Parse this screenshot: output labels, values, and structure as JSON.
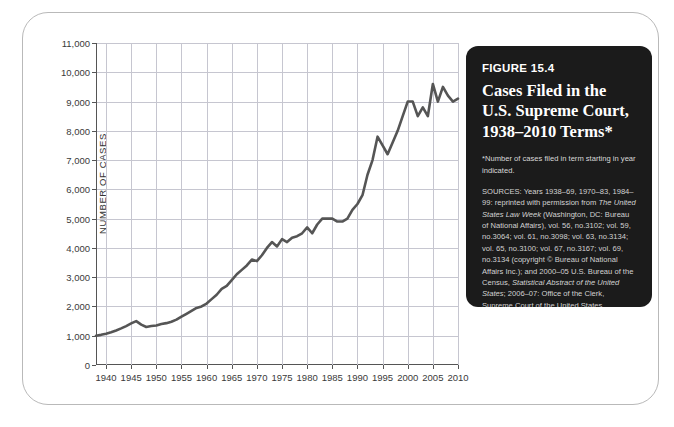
{
  "figure": {
    "number_label": "FIGURE 15.4",
    "title": "Cases Filed in the U.S. Supreme Court, 1938–2010 Terms*",
    "note": "*Number of cases filed in term starting in year indicated.",
    "sources_prefix": "SOURCES: Years 1938–69, 1970–83, 1984–99: reprinted with permission from ",
    "sources_italic_1": "The United States Law Week",
    "sources_mid": " (Washington, DC: Bureau of National Affairs), vol. 56, no.3102; vol. 59, no.3064; vol. 61, no.3098; vol. 63, no.3134; vol. 65, no.3100; vol. 67, no.3167; vol. 69, no.3134 (copyright © Bureau of National Affairs Inc.); and 2000–05 U.S. Bureau of the Census, ",
    "sources_italic_2": "Statistical Abstract of the United States",
    "sources_suffix": "; 2006–07: Office of the Clerk, Supreme Court of the United States."
  },
  "colors": {
    "panel_background": "#1b1b1b",
    "series_line": "#555555",
    "gridline": "#c6c6d0",
    "axis": "#555555",
    "frame_border": "#b9b9b9",
    "page_background": "#ffffff"
  },
  "chart_data": {
    "type": "line",
    "title": "Cases Filed in the U.S. Supreme Court, 1938–2010 Terms",
    "xlabel": "",
    "ylabel": "NUMBER OF CASES",
    "xlim": [
      1938,
      2010
    ],
    "ylim": [
      0,
      11000
    ],
    "ytick_values": [
      0,
      1000,
      2000,
      3000,
      4000,
      5000,
      6000,
      7000,
      8000,
      9000,
      10000,
      11000
    ],
    "ytick_labels": [
      "0",
      "1,000",
      "2,000",
      "3,000",
      "4,000",
      "5,000",
      "6,000",
      "7,000",
      "8,000",
      "9,000",
      "10,000",
      "11,000"
    ],
    "xtick_values": [
      1940,
      1945,
      1950,
      1955,
      1960,
      1965,
      1970,
      1975,
      1980,
      1985,
      1990,
      1995,
      2000,
      2005,
      2010
    ],
    "xtick_labels": [
      "1940",
      "1945",
      "1950",
      "1955",
      "1960",
      "1965",
      "1970",
      "1975",
      "1980",
      "1985",
      "1990",
      "1995",
      "2000",
      "2005",
      "2010"
    ],
    "grid": true,
    "legend": false,
    "series": [
      {
        "name": "Cases filed",
        "x": [
          1938,
          1939,
          1940,
          1941,
          1942,
          1943,
          1944,
          1945,
          1946,
          1947,
          1948,
          1949,
          1950,
          1951,
          1952,
          1953,
          1954,
          1955,
          1956,
          1957,
          1958,
          1959,
          1960,
          1961,
          1962,
          1963,
          1964,
          1965,
          1966,
          1967,
          1968,
          1969,
          1970,
          1971,
          1972,
          1973,
          1974,
          1975,
          1976,
          1977,
          1978,
          1979,
          1980,
          1981,
          1982,
          1983,
          1984,
          1985,
          1986,
          1987,
          1988,
          1989,
          1990,
          1991,
          1992,
          1993,
          1994,
          1995,
          1996,
          1997,
          1998,
          1999,
          2000,
          2001,
          2002,
          2003,
          2004,
          2005,
          2006,
          2007,
          2008,
          2009,
          2010
        ],
        "y": [
          1000,
          1030,
          1070,
          1120,
          1180,
          1250,
          1330,
          1420,
          1500,
          1380,
          1300,
          1330,
          1350,
          1400,
          1430,
          1480,
          1550,
          1650,
          1750,
          1850,
          1950,
          2000,
          2100,
          2250,
          2400,
          2600,
          2700,
          2900,
          3100,
          3250,
          3400,
          3600,
          3550,
          3750,
          4000,
          4200,
          4050,
          4300,
          4200,
          4350,
          4400,
          4500,
          4700,
          4500,
          4800,
          5000,
          5000,
          5000,
          4900,
          4900,
          5000,
          5300,
          5500,
          5800,
          6500,
          7000,
          7800,
          7500,
          7200,
          7600,
          8000,
          8500,
          9000,
          9000,
          8500,
          8800,
          8500,
          9600,
          9000,
          9500,
          9200,
          9000,
          9100
        ]
      }
    ]
  }
}
